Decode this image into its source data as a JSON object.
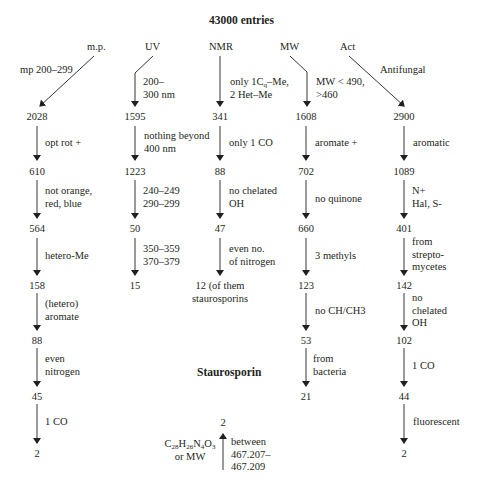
{
  "title": "43000 entries",
  "conclusion_label": "Staurosporin",
  "columns": [
    {
      "id": "mp",
      "header": "m.p.",
      "first_filter": "mp 200–299",
      "counts": [
        "2028",
        "610",
        "564",
        "158",
        "88",
        "45",
        "2"
      ],
      "filters": [
        "opt rot +",
        "not orange,\nred, blue",
        "hetero-Me",
        "(hetero)\naromate",
        "even\nnitrogen",
        "1 CO"
      ]
    },
    {
      "id": "uv",
      "header": "UV",
      "first_filter": "200–\n300 nm",
      "counts": [
        "1595",
        "1223",
        "50",
        "15"
      ],
      "filters": [
        "nothing beyond\n400 nm",
        "240–249\n290–299",
        "350–359\n370–379"
      ]
    },
    {
      "id": "nmr",
      "header": "NMR",
      "first_filter_parts": [
        "only 1C",
        "q",
        "–Me,",
        "2 Het–Me"
      ],
      "counts": [
        "341",
        "88",
        "47",
        "12 (of them\nstaurosporins"
      ],
      "filters": [
        "only 1 CO",
        "no chelated\nOH",
        "even no.\nof nitrogen"
      ]
    },
    {
      "id": "mw",
      "header": "MW",
      "first_filter": "MW < 490,\n>460",
      "counts": [
        "1608",
        "702",
        "660",
        "123",
        "53",
        "21"
      ],
      "filters": [
        "aromate +",
        "no quinone",
        "3 methyls",
        "no CH/CH3",
        "from\nbacteria"
      ]
    },
    {
      "id": "act",
      "header": "Act",
      "first_filter": "Antifungal",
      "counts": [
        "2900",
        "1089",
        "401",
        "142",
        "102",
        "44",
        "2"
      ],
      "filters": [
        "aromatic",
        "N+\nHal, S-",
        "from\nstrepto-\nmycetes",
        "no\nchelated\nOH",
        "1 CO",
        "fluorescent"
      ]
    }
  ],
  "formula": {
    "result": "2",
    "formula_parts": [
      "C",
      "28",
      "H",
      "26",
      "N",
      "4",
      "O",
      "3"
    ],
    "or_label": "or MW",
    "range_label": "between\n467.207–\n467.209"
  }
}
